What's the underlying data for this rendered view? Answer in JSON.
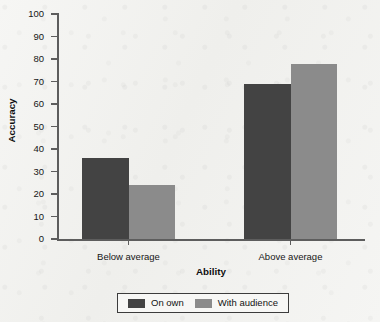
{
  "chart_data": {
    "type": "bar",
    "title": "",
    "xlabel": "Ability",
    "ylabel": "Accuracy",
    "categories": [
      "Below average",
      "Above average"
    ],
    "series": [
      {
        "name": "On own",
        "values": [
          36,
          69
        ],
        "color": "#434343"
      },
      {
        "name": "With audience",
        "values": [
          24,
          78
        ],
        "color": "#8b8b8b"
      }
    ],
    "ylim": [
      0,
      100
    ],
    "yticks": [
      0,
      10,
      20,
      30,
      40,
      50,
      60,
      70,
      80,
      90,
      100
    ],
    "ytick_labels": [
      "0",
      "10",
      "20",
      "30",
      "40",
      "50",
      "60",
      "70",
      "80",
      "90",
      "100"
    ],
    "grid": false,
    "legend_position": "bottom-center"
  },
  "legend": {
    "items": [
      {
        "label": "On own"
      },
      {
        "label": "With audience"
      }
    ]
  }
}
